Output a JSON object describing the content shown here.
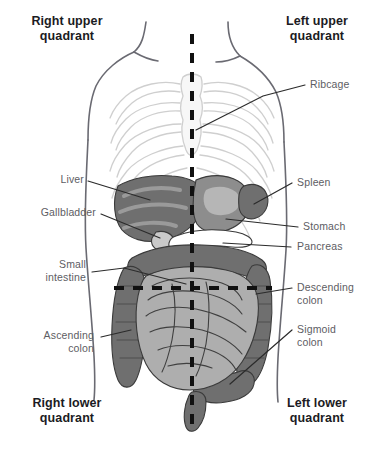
{
  "diagram": {
    "colors": {
      "background": "#ffffff",
      "heading_text": "#1b1b23",
      "label_text": "#5d5d63",
      "leader_line": "#2b2b2b",
      "body_outline": "#6a6a72",
      "ribcage_fill": "#f2f2f2",
      "ribcage_stroke": "#cfcfcf",
      "organ_dark": "#6f6f6f",
      "organ_mid": "#8d8d8d",
      "organ_light": "#aeaeae",
      "organ_pale": "#c9c9c9",
      "highlight_white": "#ffffff",
      "dashed_line": "#111111"
    },
    "quadrants": [
      {
        "id": "right-upper",
        "label": "Right upper\nquadrant"
      },
      {
        "id": "left-upper",
        "label": "Left upper\nquadrant"
      },
      {
        "id": "right-lower",
        "label": "Right lower\nquadrant"
      },
      {
        "id": "left-lower",
        "label": "Left lower\nquadrant"
      }
    ],
    "labels": [
      {
        "id": "ribcage",
        "text": "Ribcage",
        "side": "left"
      },
      {
        "id": "liver",
        "text": "Liver",
        "side": "right"
      },
      {
        "id": "gallbladder",
        "text": "Gallbladder",
        "side": "right"
      },
      {
        "id": "small-intestine",
        "text": "Small\nintestine",
        "side": "right"
      },
      {
        "id": "ascending-colon",
        "text": "Ascending\ncolon",
        "side": "right"
      },
      {
        "id": "spleen",
        "text": "Spleen",
        "side": "left"
      },
      {
        "id": "stomach",
        "text": "Stomach",
        "side": "left"
      },
      {
        "id": "pancreas",
        "text": "Pancreas",
        "side": "left"
      },
      {
        "id": "descending-colon",
        "text": "Descending\ncolon",
        "side": "left"
      },
      {
        "id": "sigmoid-colon",
        "text": "Sigmoid\ncolon",
        "side": "left"
      }
    ]
  }
}
